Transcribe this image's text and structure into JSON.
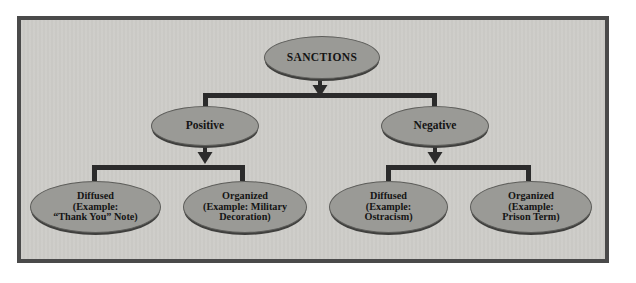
{
  "diagram": {
    "colors": {
      "page_background": "#ffffff",
      "frame_background": "#cccbc7",
      "frame_border": "#4a4a4a",
      "node_fill": "#9a9a96",
      "node_border": "#5d5d5a",
      "node_shadow": "#3f3f3d",
      "connector": "#2b2b2b",
      "text": "#141414"
    },
    "root": {
      "id": "sanctions",
      "label": "SANCTIONS",
      "lines": [
        "SANCTIONS"
      ]
    },
    "level2": [
      {
        "id": "positive",
        "label": "Positive",
        "lines": [
          "Positive"
        ]
      },
      {
        "id": "negative",
        "label": "Negative",
        "lines": [
          "Negative"
        ]
      }
    ],
    "level3": [
      {
        "id": "positive-diffused",
        "parent": "positive",
        "label": "Diffused (Example: \"Thank You\" Note)",
        "lines": [
          "Diffused",
          "(Example:",
          "“Thank You” Note)"
        ]
      },
      {
        "id": "positive-organized",
        "parent": "positive",
        "label": "Organized (Example: Military Decoration)",
        "lines": [
          "Organized",
          "(Example: Military",
          "Decoration)"
        ]
      },
      {
        "id": "negative-diffused",
        "parent": "negative",
        "label": "Diffused (Example: Ostracism)",
        "lines": [
          "Diffused",
          "(Example:",
          "Ostracism)"
        ]
      },
      {
        "id": "negative-organized",
        "parent": "negative",
        "label": "Organized (Example: Prison Term)",
        "lines": [
          "Organized",
          "(Example:",
          "Prison Term)"
        ]
      }
    ]
  }
}
